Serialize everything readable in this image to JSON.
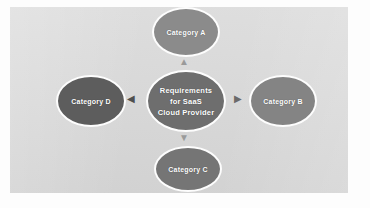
{
  "diagram": {
    "type": "hub-and-spoke",
    "center": {
      "label_line1": "Requirements",
      "label_line2": "for SaaS",
      "label_line3": "Cloud Provider",
      "fill": "#6e6e6e"
    },
    "nodes": [
      {
        "id": "a",
        "label": "Category A",
        "position": "top",
        "fill": "#8b8b8b"
      },
      {
        "id": "b",
        "label": "Category B",
        "position": "right",
        "fill": "#848484"
      },
      {
        "id": "c",
        "label": "Category C",
        "position": "bottom",
        "fill": "#757575"
      },
      {
        "id": "d",
        "label": "Category D",
        "position": "left",
        "fill": "#5d5d5d"
      }
    ],
    "connectors": [
      {
        "id": "top",
        "glyph": "▲",
        "from": "center",
        "to": "a"
      },
      {
        "id": "right",
        "glyph": "▶",
        "from": "center",
        "to": "b"
      },
      {
        "id": "bottom",
        "glyph": "▼",
        "from": "center",
        "to": "c"
      },
      {
        "id": "left",
        "glyph": "◀",
        "from": "center",
        "to": "d"
      }
    ],
    "canvas": {
      "background": "#d9d9d9",
      "outer_background": "#fdfdfd",
      "node_outline": "#fdfdfd",
      "label_color": "#ffffff"
    }
  }
}
